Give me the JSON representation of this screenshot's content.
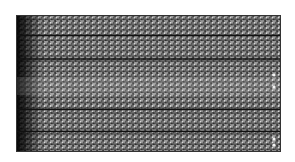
{
  "figure": {
    "kind": "triangular-mesh",
    "bounds": {
      "x": 16,
      "y": 15,
      "width": 265,
      "height": 137
    },
    "colors": {
      "background": "#ffffff",
      "mesh_fill": "#8a8a8a",
      "mesh_edge": "#1a1a1a",
      "left_edge_dark": "#111111",
      "highlight_nodes": "#f0f0f0"
    },
    "horizontal_layer_lines_y_fraction": [
      0.15,
      0.32,
      0.69,
      0.85
    ],
    "cell_size_px": 6,
    "caption": ""
  }
}
